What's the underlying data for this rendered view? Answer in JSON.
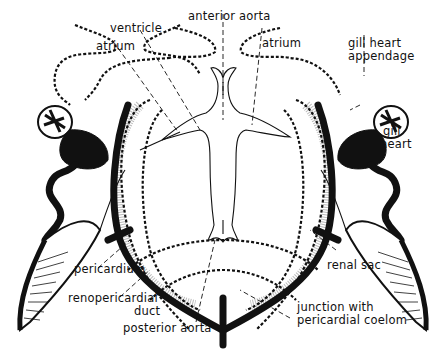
{
  "figure": {
    "labels": {
      "anterior_aorta": "anterior aorta",
      "ventricle": "ventricle",
      "atrium_left": "atrium",
      "atrium_right": "atrium",
      "gill_heart_appendage_1": "gill heart",
      "gill_heart_appendage_2": "appendage",
      "gill_heart_1": "gill",
      "gill_heart_2": "heart",
      "pericardium": "pericardium",
      "renopericardial_1": "renopericardial",
      "renopericardial_2": "duct",
      "posterior_aorta": "posterior aorta",
      "renal_sac": "renal sac",
      "junction_1": "junction with",
      "junction_2": "pericardial coelom"
    }
  }
}
